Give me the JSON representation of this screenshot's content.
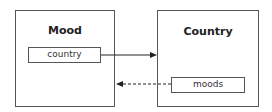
{
  "entities": [
    {
      "name": "Mood",
      "fields": [
        "country"
      ]
    },
    {
      "name": "Country",
      "fields": [
        "moods"
      ]
    }
  ],
  "relations": [
    {
      "from": "Mood.country",
      "to": "Country",
      "style": "solid"
    },
    {
      "from": "Country.moods",
      "to": "Mood",
      "style": "dashed"
    }
  ]
}
